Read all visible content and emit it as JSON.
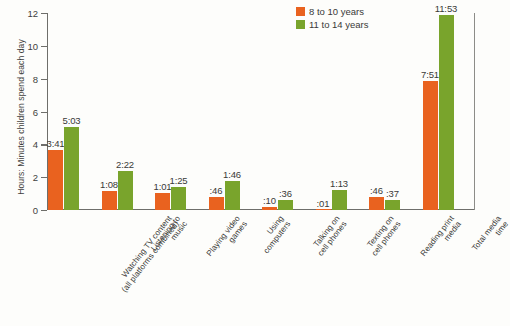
{
  "chart_data": {
    "type": "bar",
    "title": "",
    "subtitle": "",
    "xlabel": "",
    "ylabel": "Hours: Minutes children spend each day",
    "ylim": [
      0,
      12
    ],
    "yticks": [
      0,
      2,
      4,
      6,
      8,
      10,
      12
    ],
    "grid": false,
    "legend_position": "top-right",
    "categories": [
      "Watching TV content (all platforms combined)",
      "Listening to music",
      "Playing video games",
      "Using computers",
      "Talking on cell phones",
      "Texting on cell phones",
      "Reading print media",
      "Total media time"
    ],
    "category_lines": [
      [
        "Watching TV content",
        "(all platforms combined)"
      ],
      [
        "Listening to",
        "music"
      ],
      [
        "Playing video",
        "games"
      ],
      [
        "Using",
        "computers"
      ],
      [
        "Talking on",
        "cell phones"
      ],
      [
        "Texting on",
        "cell phones"
      ],
      [
        "Reading print",
        "media"
      ],
      [
        "Total media",
        "time"
      ]
    ],
    "series": [
      {
        "name": "8 to 10 years",
        "color": "#e9621f",
        "labels": [
          "3:41",
          "1:08",
          "1:01",
          ":46",
          ":10",
          ":01",
          ":46",
          "7:51"
        ],
        "values": [
          3.683,
          1.133,
          1.017,
          0.767,
          0.167,
          0.017,
          0.767,
          7.85
        ]
      },
      {
        "name": "11 to 14 years",
        "color": "#79a42c",
        "labels": [
          "5:03",
          "2:22",
          "1:25",
          "1:46",
          ":36",
          "1:13",
          ":37",
          "11:53"
        ],
        "values": [
          5.05,
          2.367,
          1.417,
          1.767,
          0.6,
          1.217,
          0.617,
          11.883
        ]
      }
    ]
  },
  "legend": {
    "items": [
      {
        "label": "8 to 10 years",
        "color": "#e9621f"
      },
      {
        "label": "11 to 14 years",
        "color": "#79a42c"
      }
    ]
  },
  "axis": {
    "y_title": "Hours: Minutes children spend each day",
    "y_tick_labels": [
      "0",
      "2",
      "4",
      "6",
      "8",
      "10",
      "12"
    ]
  }
}
